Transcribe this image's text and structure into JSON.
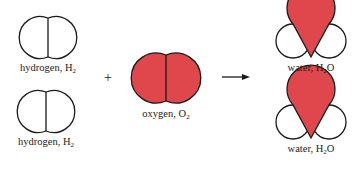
{
  "diagram": {
    "title": "",
    "colors": {
      "oxygen": "#e0474c",
      "hydrogen": "#ffffff",
      "outline": "#1a1a1a"
    },
    "reactants": [
      {
        "id": "h2-top",
        "name": "hydrogen",
        "formula_base": "H",
        "formula_sub": "2",
        "formula_tail": ""
      },
      {
        "id": "h2-bottom",
        "name": "hydrogen",
        "formula_base": "H",
        "formula_sub": "2",
        "formula_tail": ""
      },
      {
        "id": "o2",
        "name": "oxygen",
        "formula_base": "O",
        "formula_sub": "2",
        "formula_tail": ""
      }
    ],
    "products": [
      {
        "id": "h2o-top",
        "name": "water",
        "formula_base": "H",
        "formula_sub": "2",
        "formula_tail": "O"
      },
      {
        "id": "h2o-bottom",
        "name": "water",
        "formula_base": "H",
        "formula_sub": "2",
        "formula_tail": "O"
      }
    ],
    "operators": {
      "plus": "+",
      "arrow": "→"
    }
  }
}
